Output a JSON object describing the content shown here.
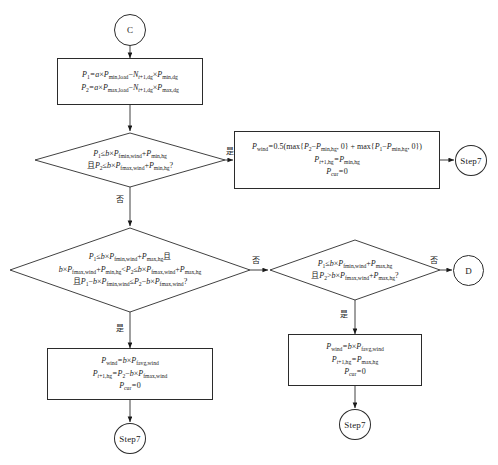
{
  "diagram": {
    "language": "zh-CN",
    "stroke_color": "#2b2b2b",
    "background_color": "#ffffff"
  },
  "nodes": {
    "start_terminal": {
      "label": "C"
    },
    "process_p1p2": {
      "line1": "P₁=a×P_min,load−N_t+1,dg×P_min,dg",
      "line2": "P₂=a×P_max,load−N_t+1,dg×P_max,dg"
    },
    "decision_1": {
      "line1": "P₁≤b×P_fmin,wind+P_min,hg",
      "line2": "且P₂≤b×P_fmax,wind+P_min,hg?"
    },
    "process_wind_min": {
      "line1": "P_wind=0.5(max{P₂−P_min,hg, 0} + max{P₁−P_min,hg, 0})",
      "line2": "P_t+1,hg=P_min,hg",
      "line3": "P_cur=0"
    },
    "terminal_step7_top": {
      "label": "Step7"
    },
    "decision_2": {
      "line1": "P₁≤b×P_fmin,wind+P_max,hg且",
      "line2": "b×P_fmax,wind+P_min,hg<P₂≤b×P_fmax,wind+P_max,hg",
      "line3": "且P₁−b×P_fmin,wind≤P₂−b×P_fmax,wind?"
    },
    "decision_3": {
      "line1": "P₁≤b×P_fmin,wind+P_max,hg",
      "line2": "且P₂>b×P_fmax,wind+P_max,hg?"
    },
    "terminal_d": {
      "label": "D"
    },
    "process_avg_left": {
      "line1": "P_wind=b×P_favg,wind",
      "line2": "P_t+1,hg=P₂−b×P_fmax,wind",
      "line3": "P_cur=0"
    },
    "process_avg_right": {
      "line1": "P_wind=b×P_favg,wind",
      "line2": "P_t+1,hg=P_max,hg",
      "line3": "P_cur=0"
    },
    "terminal_step7_bottom_left": {
      "label": "Step7"
    },
    "terminal_step7_bottom_right": {
      "label": "Step7"
    }
  },
  "branch_labels": {
    "d1_yes": "是",
    "d1_no": "否",
    "d2_yes": "是",
    "d2_no": "否",
    "d3_yes": "是",
    "d3_no": "否"
  }
}
